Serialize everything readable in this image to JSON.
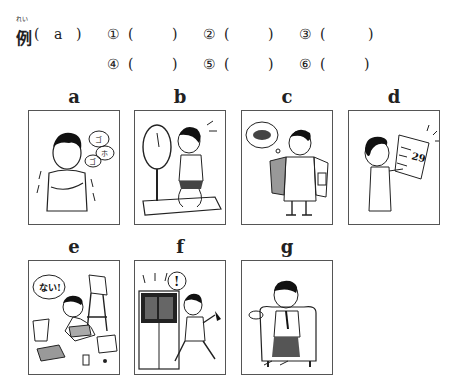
{
  "example": {
    "ruby": "れい",
    "label": "例",
    "open": "(",
    "answer": "a",
    "close": ")"
  },
  "answers": [
    {
      "num": "①",
      "open": "(",
      "value": "",
      "close": ")"
    },
    {
      "num": "②",
      "open": "(",
      "value": "",
      "close": ")"
    },
    {
      "num": "③",
      "open": "(",
      "value": "",
      "close": ")"
    },
    {
      "num": "④",
      "open": "(",
      "value": "",
      "close": ")"
    },
    {
      "num": "⑤",
      "open": "(",
      "value": "",
      "close": ")"
    },
    {
      "num": "⑥",
      "open": "(",
      "value": "",
      "close": ")"
    }
  ],
  "pictures": [
    {
      "label": "a",
      "description": "boy shivering with cough bubbles",
      "bubble": "ゴホゴホ"
    },
    {
      "label": "b",
      "description": "boy on scale worried about weight"
    },
    {
      "label": "c",
      "description": "man with empty pockets thinking of wallet"
    },
    {
      "label": "d",
      "description": "boy reading calendar/flyer surprised",
      "sign": "29"
    },
    {
      "label": "e",
      "description": "boy searching messy room",
      "bubble": "ない!"
    },
    {
      "label": "f",
      "description": "man rushing with closing elevator/train doors",
      "bubble": "!"
    },
    {
      "label": "g",
      "description": "tired man sighing in armchair"
    }
  ]
}
